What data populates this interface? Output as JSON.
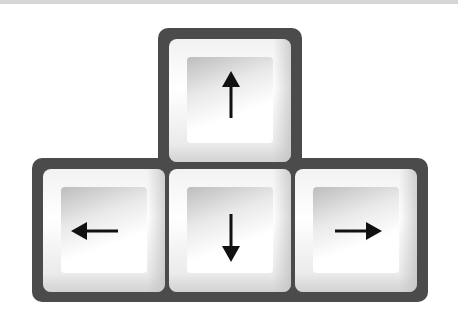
{
  "illustration": {
    "subject": "keyboard arrow keys",
    "colors": {
      "frame": "#4b4b4b",
      "key_face": "#f4f4f4",
      "arrow": "#111111"
    },
    "keys": [
      {
        "id": "up",
        "icon": "arrow-up-icon",
        "glyph": "↑"
      },
      {
        "id": "left",
        "icon": "arrow-left-icon",
        "glyph": "←"
      },
      {
        "id": "down",
        "icon": "arrow-down-icon",
        "glyph": "↓"
      },
      {
        "id": "right",
        "icon": "arrow-right-icon",
        "glyph": "→"
      }
    ]
  }
}
